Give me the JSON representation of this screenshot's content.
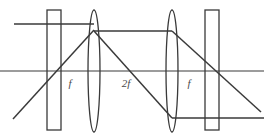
{
  "figure": {
    "type": "optical-ray-diagram",
    "width": 264,
    "height": 139,
    "background_color": "#ffffff",
    "stroke_color": "#3a3a3a",
    "label_color": "#4a4a4a"
  },
  "labels": [
    {
      "id": "focal-left",
      "text": "f",
      "x": 70,
      "y": 87
    },
    {
      "id": "focal-mid",
      "text": "2f",
      "x": 122,
      "y": 87
    },
    {
      "id": "focal-right",
      "text": "f",
      "x": 186,
      "y": 87
    }
  ],
  "optical_axis": {
    "name": "optical-axis",
    "x1": 0,
    "y1": 71,
    "x2": 264,
    "y2": 71
  },
  "elements": [
    {
      "id": "aperture-left",
      "kind": "rectangle",
      "x": 47,
      "y": 10,
      "width": 14,
      "height": 120
    },
    {
      "id": "lens-first",
      "kind": "ellipse",
      "cx": 94,
      "cy": 71,
      "rx": 6,
      "ry": 61
    },
    {
      "id": "lens-second",
      "kind": "ellipse",
      "cx": 172,
      "cy": 71,
      "rx": 6,
      "ry": 61
    },
    {
      "id": "aperture-right",
      "kind": "rectangle",
      "x": 205,
      "y": 10,
      "width": 14,
      "height": 120
    }
  ],
  "rays": [
    {
      "id": "ray-incoming-horizontal",
      "x1": 14,
      "y1": 24,
      "x2": 94,
      "y2": 24
    },
    {
      "id": "ray-incoming-diagonal",
      "x1": 13,
      "y1": 119,
      "x2": 94,
      "y2": 30
    },
    {
      "id": "ray-mid-horizontal",
      "x1": 94,
      "y1": 31,
      "x2": 172,
      "y2": 31
    },
    {
      "id": "ray-mid-diagonal",
      "x1": 94,
      "y1": 31,
      "x2": 172,
      "y2": 118
    },
    {
      "id": "ray-output-horizontal",
      "x1": 172,
      "y1": 118,
      "x2": 264,
      "y2": 118
    },
    {
      "id": "ray-output-diagonal",
      "x1": 172,
      "y1": 31,
      "x2": 261,
      "y2": 112
    }
  ]
}
